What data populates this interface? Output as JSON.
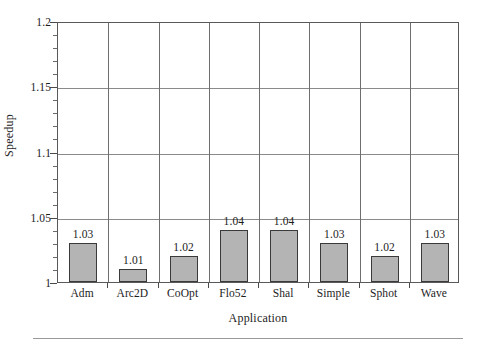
{
  "chart_data": {
    "type": "bar",
    "title": "",
    "xlabel": "Application",
    "ylabel": "Speedup",
    "categories": [
      "Adm",
      "Arc2D",
      "CoOpt",
      "Flo52",
      "Shal",
      "Simple",
      "Sphot",
      "Wave"
    ],
    "values": [
      1.03,
      1.01,
      1.02,
      1.04,
      1.04,
      1.03,
      1.02,
      1.03
    ],
    "value_labels": [
      "1.03",
      "1.01",
      "1.02",
      "1.04",
      "1.04",
      "1.03",
      "1.02",
      "1.03"
    ],
    "ylim": [
      1,
      1.2
    ],
    "ytick_labels": [
      "1",
      "1.05",
      "1.1",
      "1.15",
      "1.2"
    ],
    "ytick_values": [
      1,
      1.05,
      1.1,
      1.15,
      1.2
    ],
    "yminor_step": 0.01,
    "grid": "both",
    "legend": "none",
    "bar_fill_color": "#b4b4b4",
    "bar_border_color": "#3a3a3a",
    "gridline_color": "#8a8a8a",
    "axis_color": "#595959",
    "background_color": "#ffffff"
  }
}
